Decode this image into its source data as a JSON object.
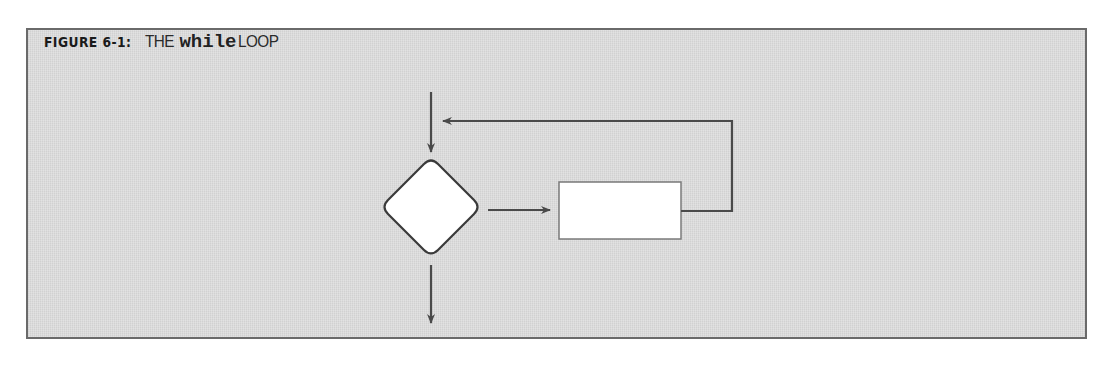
{
  "figure": {
    "label": "FIGURE 6-1:",
    "title_prefix": "THE",
    "title_code": "while",
    "title_suffix": "LOOP"
  },
  "diagram": {
    "type": "flowchart",
    "nodes": [
      {
        "id": "condition",
        "shape": "diamond",
        "label": ""
      },
      {
        "id": "body",
        "shape": "rectangle",
        "label": ""
      }
    ],
    "edges": [
      {
        "id": "entry",
        "from": "start",
        "to": "condition"
      },
      {
        "id": "true-branch",
        "from": "condition",
        "to": "body"
      },
      {
        "id": "loop-back",
        "from": "body",
        "to": "entry"
      },
      {
        "id": "exit",
        "from": "condition",
        "to": "end"
      }
    ],
    "colors": {
      "stroke": "#4a4a4a",
      "node_fill": "#ffffff",
      "background": "#dcdcdc",
      "border": "#6a6a6a"
    }
  }
}
